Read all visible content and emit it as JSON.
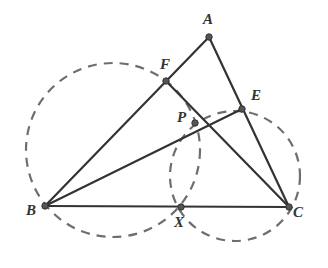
{
  "diagram": {
    "type": "geometry-figure",
    "colors": {
      "line": "#333333",
      "dashed_circle": "#6e6e6e",
      "point": "#555555",
      "label": "#333333"
    },
    "points": [
      {
        "name": "A",
        "x": 209,
        "y": 37,
        "label_x": 203,
        "label_y": 12
      },
      {
        "name": "B",
        "x": 45,
        "y": 206,
        "label_x": 26,
        "label_y": 203
      },
      {
        "name": "C",
        "x": 289,
        "y": 207,
        "label_x": 293,
        "label_y": 205
      },
      {
        "name": "E",
        "x": 242,
        "y": 109,
        "label_x": 251,
        "label_y": 88
      },
      {
        "name": "F",
        "x": 166,
        "y": 81,
        "label_x": 160,
        "label_y": 57
      },
      {
        "name": "P",
        "x": 195,
        "y": 123,
        "label_x": 177,
        "label_y": 110
      },
      {
        "name": "X",
        "x": 181,
        "y": 207,
        "label_x": 174,
        "label_y": 215
      }
    ],
    "segments": [
      {
        "name": "AB",
        "from": "A",
        "to": "B"
      },
      {
        "name": "AC",
        "from": "A",
        "to": "C"
      },
      {
        "name": "BC",
        "from": "B",
        "to": "C"
      },
      {
        "name": "BE",
        "from": "B",
        "to": "E"
      },
      {
        "name": "CF",
        "from": "C",
        "to": "F"
      }
    ],
    "circles": [
      {
        "name": "circle-BFPX",
        "cx": 113,
        "cy": 150,
        "r": 87,
        "style": "dashed"
      },
      {
        "name": "circle-CEPX",
        "cx": 235,
        "cy": 176,
        "r": 65,
        "style": "dashed"
      }
    ],
    "labels": {
      "A": "A",
      "B": "B",
      "C": "C",
      "E": "E",
      "F": "F",
      "P": "P",
      "X": "X"
    }
  }
}
